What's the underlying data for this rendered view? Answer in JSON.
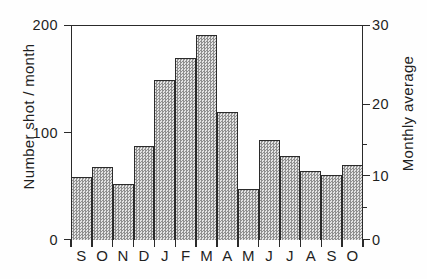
{
  "chart_data": {
    "type": "bar",
    "title": "",
    "subtitle": "",
    "categories": [
      "S",
      "O",
      "N",
      "D",
      "J",
      "F",
      "M",
      "A",
      "M",
      "J",
      "J",
      "A",
      "S",
      "O"
    ],
    "values": [
      63,
      73,
      56,
      94,
      160,
      182,
      205,
      128,
      51,
      100,
      84,
      69,
      65,
      75
    ],
    "series": [
      {
        "name": "Number shot / month",
        "values": [
          63,
          73,
          56,
          94,
          160,
          182,
          205,
          128,
          51,
          100,
          84,
          69,
          65,
          75
        ]
      }
    ],
    "xlabel": "",
    "ylabel": "Number shot / month",
    "y2label": "Monthly average",
    "ylim": [
      0,
      215
    ],
    "y2lim": [
      0,
      30
    ],
    "yticks": [
      0,
      100,
      200
    ],
    "yticklabels": [
      "0",
      "100",
      "200"
    ],
    "y2ticks": [
      0,
      10,
      20,
      30
    ],
    "y2ticklabels": [
      "0",
      "10",
      "20",
      "30"
    ],
    "xticklabels": [
      "S",
      "O",
      "N",
      "D",
      "J",
      "F",
      "M",
      "A",
      "M",
      "J",
      "J",
      "A",
      "S",
      "O"
    ],
    "grid": false,
    "legend": null,
    "bar_fill": "#c9c9c9",
    "bar_edge": "#2b2b2b",
    "axis_color": "#2a2a2a"
  },
  "axes": {
    "left": {
      "title": "Number shot / month",
      "ticks": [
        {
          "label": "200",
          "value": 200
        },
        {
          "label": "100",
          "value": 100
        },
        {
          "label": "0",
          "value": 0
        }
      ]
    },
    "right": {
      "title": "Monthly average",
      "ticks": [
        {
          "label": "30",
          "value": 30
        },
        {
          "label": "20",
          "value": 20
        },
        {
          "label": "10",
          "value": 10
        },
        {
          "label": "0",
          "value": 0
        }
      ]
    },
    "bottom": {
      "title": "",
      "ticks": [
        "S",
        "O",
        "N",
        "D",
        "J",
        "F",
        "M",
        "A",
        "M",
        "J",
        "J",
        "A",
        "S",
        "O"
      ]
    }
  }
}
